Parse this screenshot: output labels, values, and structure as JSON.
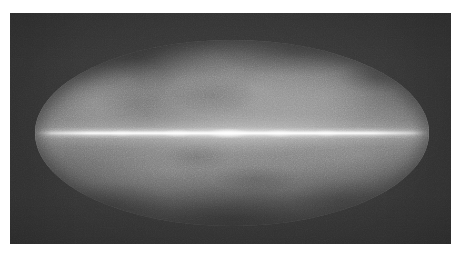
{
  "figure": {
    "name": "all-sky-map",
    "projection": "Mollweide",
    "coordinate_system": "Galactic",
    "rendering": "grayscale",
    "alt_text": "Grayscale Mollweide all-sky map showing a bright narrow galactic plane band across the centre with diffuse cloud-like emission above and below"
  },
  "plate": {
    "background_color": "#343434",
    "x": 10,
    "y": 13,
    "width": 441,
    "height": 231
  },
  "page": {
    "background_color": "#ffffff",
    "width": 461,
    "height": 257
  },
  "ellipse": {
    "center_x": 232,
    "center_y": 133,
    "semi_major_axis": 197,
    "semi_minor_axis": 93,
    "limb_color": "#585858"
  },
  "chart_data": {
    "type": "heatmap",
    "title": "",
    "subtitle": "",
    "xlabel": "",
    "ylabel": "",
    "projection": "Mollweide (equal-area all-sky)",
    "colormap": "grayscale",
    "grid": false,
    "legend": "none",
    "xlim": [
      180,
      -180
    ],
    "ylim": [
      -90,
      90
    ],
    "x_tick_labels": [],
    "y_tick_labels": [],
    "annotations": [],
    "features": [
      {
        "name": "galactic-plane-ridge",
        "galactic_longitude_deg": 0,
        "galactic_latitude_deg": 0,
        "relative_intensity": 1.0,
        "description": "narrow bright band across full longitude at b = 0"
      },
      {
        "name": "galactic-center-knot",
        "galactic_longitude_deg": 0,
        "galactic_latitude_deg": 0,
        "relative_intensity": 0.95,
        "description": "brightest concentration at map centre"
      },
      {
        "name": "inner-arm-tangent-left",
        "galactic_longitude_deg": 50,
        "galactic_latitude_deg": 0,
        "relative_intensity": 0.72,
        "description": "secondary plane brightening left of centre"
      },
      {
        "name": "inner-arm-tangent-right",
        "galactic_longitude_deg": -47,
        "galactic_latitude_deg": 0,
        "relative_intensity": 0.72,
        "description": "secondary plane brightening right of centre"
      },
      {
        "name": "north-diffuse-bulge",
        "galactic_longitude_deg": -22,
        "galactic_latitude_deg": 42,
        "relative_intensity": 0.52,
        "description": "broad bright diffuse emission filling the upper middle-right hemisphere"
      },
      {
        "name": "north-polar-patch",
        "galactic_longitude_deg": 126,
        "galactic_latitude_deg": 30,
        "relative_intensity": 0.45,
        "description": "brighter patch in the upper-left quadrant"
      },
      {
        "name": "north-dark-lane",
        "galactic_longitude_deg": 86,
        "galactic_latitude_deg": 70,
        "relative_intensity": 0.15,
        "description": "dark arc near the northern limb"
      },
      {
        "name": "south-diffuse-band",
        "galactic_longitude_deg": 58,
        "galactic_latitude_deg": -36,
        "relative_intensity": 0.4,
        "description": "moderate diffuse emission below the plane, left of centre"
      },
      {
        "name": "south-polar-dark",
        "galactic_longitude_deg": 0,
        "galactic_latitude_deg": -80,
        "relative_intensity": 0.1,
        "description": "darkest region toward the southern galactic pole"
      }
    ],
    "intensity_scale": {
      "min_gray": "#3a3a3a",
      "mid_gray": "#8f8f8f",
      "max_gray": "#ffffff"
    },
    "latitude_profile": {
      "comment": "relative intensity sampled vertically through map centre",
      "latitudes_deg": [
        90,
        75,
        60,
        45,
        30,
        15,
        5,
        0,
        -5,
        -15,
        -30,
        -45,
        -60,
        -75,
        -90
      ],
      "values": [
        0.12,
        0.18,
        0.26,
        0.36,
        0.47,
        0.62,
        0.8,
        1.0,
        0.78,
        0.56,
        0.42,
        0.32,
        0.24,
        0.17,
        0.11
      ]
    },
    "longitude_profile": {
      "comment": "relative intensity sampled along the galactic plane",
      "longitudes_deg": [
        180,
        135,
        90,
        45,
        0,
        -45,
        -90,
        -135,
        -180
      ],
      "values": [
        0.42,
        0.58,
        0.7,
        0.86,
        1.0,
        0.84,
        0.68,
        0.55,
        0.42
      ]
    }
  }
}
